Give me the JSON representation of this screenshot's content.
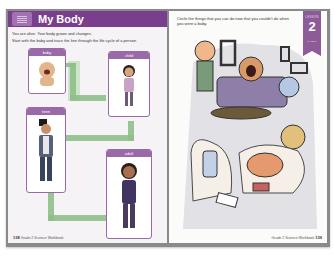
{
  "left_page": {
    "header": {
      "title": "My Body",
      "icon": "book-badge-icon",
      "color": "#7a3f8c"
    },
    "intro_lines": [
      "You are alive. Your body grows and changes.",
      "Start with the baby and trace the line through the life cycle of a person."
    ],
    "cards": [
      {
        "label": "baby",
        "figure": "baby-figure"
      },
      {
        "label": "child",
        "figure": "child-figure"
      },
      {
        "label": "teen",
        "figure": "teen-figure"
      },
      {
        "label": "adult",
        "figure": "adult-figure"
      }
    ],
    "arrow_color": "#8fbf8a",
    "card_color": "#9a6aa8",
    "page_number": "138",
    "footer_text": "Grade 2 Science Workbook"
  },
  "right_page": {
    "instruction": "Circle the things that you can do now that you couldn't do when you were a baby.",
    "lesson_tab": {
      "label": "LESSON",
      "number": "2",
      "subtitle": "My Body",
      "color": "#8c5b98"
    },
    "scene": "kids-living-room-illustration",
    "page_number": "139",
    "footer_text": "Grade 2 Science Workbook"
  }
}
